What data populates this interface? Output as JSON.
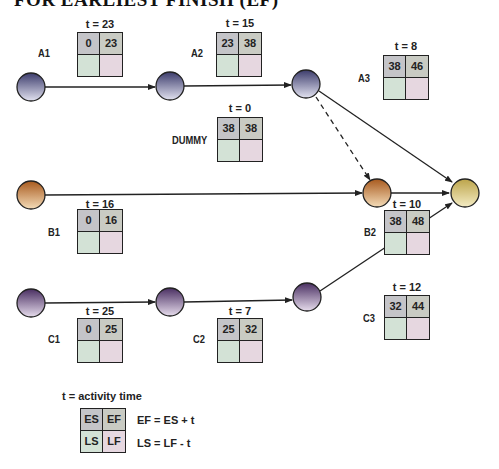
{
  "title": "FOR EARLIEST FINISH (EF)",
  "colors": {
    "node_purple": "#5a5a8a",
    "node_violet": "#5e4a7a",
    "node_orange": "#c07a3a",
    "node_yellow": "#d2c070",
    "es_cell": "#c4c4c8",
    "ef_cell": "#c9cbc3",
    "ls_cell": "#d3e2d6",
    "lf_cell": "#e6d7e0",
    "line": "#222222"
  },
  "activities": {
    "A1": {
      "label": "A1",
      "t": "t = 23",
      "es": "0",
      "ef": "23",
      "ls": "",
      "lf": ""
    },
    "A2": {
      "label": "A2",
      "t": "t = 15",
      "es": "23",
      "ef": "38",
      "ls": "",
      "lf": ""
    },
    "A3": {
      "label": "A3",
      "t": "t = 8",
      "es": "38",
      "ef": "46",
      "ls": "",
      "lf": ""
    },
    "DUMMY": {
      "label": "DUMMY",
      "t": "t = 0",
      "es": "38",
      "ef": "38",
      "ls": "",
      "lf": ""
    },
    "B1": {
      "label": "B1",
      "t": "t = 16",
      "es": "0",
      "ef": "16",
      "ls": "",
      "lf": ""
    },
    "B2": {
      "label": "B2",
      "t": "t = 10",
      "es": "38",
      "ef": "48",
      "ls": "",
      "lf": ""
    },
    "C1": {
      "label": "C1",
      "t": "t = 25",
      "es": "0",
      "ef": "25",
      "ls": "",
      "lf": ""
    },
    "C2": {
      "label": "C2",
      "t": "t = 7",
      "es": "25",
      "ef": "32",
      "ls": "",
      "lf": ""
    },
    "C3": {
      "label": "C3",
      "t": "t = 12",
      "es": "32",
      "ef": "44",
      "ls": "",
      "lf": ""
    }
  },
  "legend": {
    "title": "t = activity time",
    "es": "ES",
    "ef": "EF",
    "ls": "LS",
    "lf": "LF",
    "formula_ef": "EF = ES + t",
    "formula_ls": "LS = LF - t"
  }
}
